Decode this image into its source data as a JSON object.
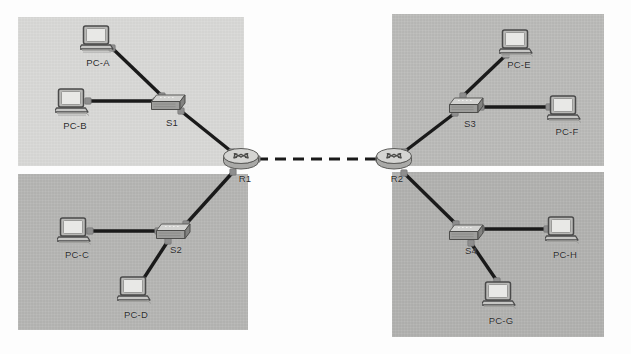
{
  "diagram": {
    "type": "network-topology",
    "canvas": {
      "width": 631,
      "height": 354,
      "background": "#fdfdfd"
    },
    "zones": [
      {
        "name": "zone-top-left",
        "x": 18,
        "y": 17,
        "w": 226,
        "h": 149,
        "fill": "#d8d8d6"
      },
      {
        "name": "zone-bottom-left",
        "x": 18,
        "y": 174,
        "w": 230,
        "h": 156,
        "fill": "#b4b4b2"
      },
      {
        "name": "zone-top-right",
        "x": 392,
        "y": 14,
        "w": 212,
        "h": 152,
        "fill": "#b9b9b7"
      },
      {
        "name": "zone-bottom-right",
        "x": 392,
        "y": 172,
        "w": 212,
        "h": 165,
        "fill": "#b0b0ae"
      }
    ],
    "nodes": [
      {
        "id": "pca",
        "label": "PC-A",
        "kind": "pc",
        "x": 98,
        "y": 40,
        "label_x": 98,
        "label_y": 57
      },
      {
        "id": "pcb",
        "label": "PC-B",
        "kind": "pc",
        "x": 73,
        "y": 103,
        "label_x": 75,
        "label_y": 120
      },
      {
        "id": "s1",
        "label": "S1",
        "kind": "switch",
        "x": 169,
        "y": 103,
        "label_x": 172,
        "label_y": 117
      },
      {
        "id": "pcc",
        "label": "PC-C",
        "kind": "pc",
        "x": 75,
        "y": 232,
        "label_x": 77,
        "label_y": 249
      },
      {
        "id": "pcd",
        "label": "PC-D",
        "kind": "pc",
        "x": 135,
        "y": 291,
        "label_x": 136,
        "label_y": 309
      },
      {
        "id": "s2",
        "label": "S2",
        "kind": "switch",
        "x": 174,
        "y": 232,
        "label_x": 176,
        "label_y": 244
      },
      {
        "id": "r1",
        "label": "R1",
        "kind": "router",
        "x": 241,
        "y": 160,
        "label_x": 245,
        "label_y": 173
      },
      {
        "id": "r2",
        "label": "R2",
        "kind": "router",
        "x": 394,
        "y": 160,
        "label_x": 397,
        "label_y": 173
      },
      {
        "id": "s3",
        "label": "S3",
        "kind": "switch",
        "x": 467,
        "y": 106,
        "label_x": 470,
        "label_y": 118
      },
      {
        "id": "pce",
        "label": "PC-E",
        "kind": "pc",
        "x": 517,
        "y": 44,
        "label_x": 519,
        "label_y": 59
      },
      {
        "id": "pcf",
        "label": "PC-F",
        "kind": "pc",
        "x": 565,
        "y": 110,
        "label_x": 567,
        "label_y": 126
      },
      {
        "id": "s4",
        "label": "S4",
        "kind": "switch",
        "x": 467,
        "y": 233,
        "label_x": 471,
        "label_y": 245
      },
      {
        "id": "pch",
        "label": "PC-H",
        "kind": "pc",
        "x": 563,
        "y": 231,
        "label_x": 565,
        "label_y": 249
      },
      {
        "id": "pcg",
        "label": "PC-G",
        "kind": "pc",
        "x": 500,
        "y": 296,
        "label_x": 501,
        "label_y": 315
      }
    ],
    "links": [
      {
        "name": "link-pca-s1",
        "from": "pca",
        "to": "s1",
        "x1": 112,
        "y1": 48,
        "x2": 162,
        "y2": 96,
        "style": "solid",
        "media": "copper"
      },
      {
        "name": "link-pcb-s1",
        "from": "pcb",
        "to": "s1",
        "x1": 88,
        "y1": 101,
        "x2": 156,
        "y2": 101,
        "style": "solid",
        "media": "copper"
      },
      {
        "name": "link-s1-r1",
        "from": "s1",
        "to": "r1",
        "x1": 181,
        "y1": 111,
        "x2": 232,
        "y2": 152,
        "style": "solid",
        "media": "copper"
      },
      {
        "name": "link-r1-s2",
        "from": "r1",
        "to": "s2",
        "x1": 233,
        "y1": 172,
        "x2": 186,
        "y2": 224,
        "style": "solid",
        "media": "copper"
      },
      {
        "name": "link-pcc-s2",
        "from": "pcc",
        "to": "s2",
        "x1": 90,
        "y1": 231,
        "x2": 158,
        "y2": 231,
        "style": "solid",
        "media": "copper"
      },
      {
        "name": "link-s2-pcd",
        "from": "s2",
        "to": "pcd",
        "x1": 168,
        "y1": 241,
        "x2": 142,
        "y2": 281,
        "style": "solid",
        "media": "copper"
      },
      {
        "name": "link-r1-r2",
        "from": "r1",
        "to": "r2",
        "x1": 257,
        "y1": 159,
        "x2": 379,
        "y2": 159,
        "style": "dashed",
        "media": "serial"
      },
      {
        "name": "link-r2-s3",
        "from": "r2",
        "to": "s3",
        "x1": 404,
        "y1": 152,
        "x2": 455,
        "y2": 113,
        "style": "solid",
        "media": "copper"
      },
      {
        "name": "link-s3-pce",
        "from": "s3",
        "to": "pce",
        "x1": 463,
        "y1": 96,
        "x2": 506,
        "y2": 55,
        "style": "solid",
        "media": "copper"
      },
      {
        "name": "link-s3-pcf",
        "from": "s3",
        "to": "pcf",
        "x1": 481,
        "y1": 107,
        "x2": 549,
        "y2": 107,
        "style": "solid",
        "media": "copper"
      },
      {
        "name": "link-r2-s4",
        "from": "r2",
        "to": "s4",
        "x1": 404,
        "y1": 173,
        "x2": 456,
        "y2": 224,
        "style": "solid",
        "media": "copper"
      },
      {
        "name": "link-s4-pch",
        "from": "s4",
        "to": "pch",
        "x1": 481,
        "y1": 229,
        "x2": 547,
        "y2": 229,
        "style": "solid",
        "media": "copper"
      },
      {
        "name": "link-s4-pcg",
        "from": "s4",
        "to": "pcg",
        "x1": 471,
        "y1": 243,
        "x2": 497,
        "y2": 281,
        "style": "solid",
        "media": "copper"
      }
    ],
    "colors": {
      "link": "#1a1a1a",
      "connector": "#8e8e8e",
      "label_text": "#2a2a2a",
      "pc_body": "#d9d9d7",
      "switch_top": "#cfcfcd",
      "switch_front": "#9a9a98",
      "router_body": "#c9c9c7"
    }
  }
}
